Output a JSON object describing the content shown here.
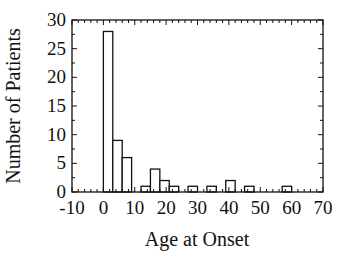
{
  "chart_data": {
    "type": "bar",
    "title": "",
    "xlabel": "Age at Onset",
    "ylabel": "Number of Patients",
    "xlim": [
      -10,
      70
    ],
    "ylim": [
      0,
      30
    ],
    "xticks": [
      -10,
      0,
      10,
      20,
      30,
      40,
      50,
      60,
      70
    ],
    "yticks": [
      0,
      5,
      10,
      15,
      20,
      25,
      30
    ],
    "bin_width": 3,
    "bins": [
      {
        "start": 0,
        "end": 3,
        "count": 28
      },
      {
        "start": 3,
        "end": 6,
        "count": 9
      },
      {
        "start": 6,
        "end": 9,
        "count": 6
      },
      {
        "start": 9,
        "end": 12,
        "count": 0
      },
      {
        "start": 12,
        "end": 15,
        "count": 1
      },
      {
        "start": 15,
        "end": 18,
        "count": 4
      },
      {
        "start": 18,
        "end": 21,
        "count": 2
      },
      {
        "start": 21,
        "end": 24,
        "count": 1
      },
      {
        "start": 24,
        "end": 27,
        "count": 0
      },
      {
        "start": 27,
        "end": 30,
        "count": 1
      },
      {
        "start": 30,
        "end": 33,
        "count": 0
      },
      {
        "start": 33,
        "end": 36,
        "count": 1
      },
      {
        "start": 36,
        "end": 39,
        "count": 0
      },
      {
        "start": 39,
        "end": 42,
        "count": 2
      },
      {
        "start": 42,
        "end": 45,
        "count": 0
      },
      {
        "start": 45,
        "end": 48,
        "count": 1
      },
      {
        "start": 48,
        "end": 51,
        "count": 0
      },
      {
        "start": 51,
        "end": 54,
        "count": 0
      },
      {
        "start": 54,
        "end": 57,
        "count": 0
      },
      {
        "start": 57,
        "end": 60,
        "count": 1
      }
    ],
    "grid": false,
    "legend": null,
    "style": {
      "bar_fill": "#ffffff",
      "bar_stroke": "#111111",
      "axis_color": "#111111"
    }
  }
}
